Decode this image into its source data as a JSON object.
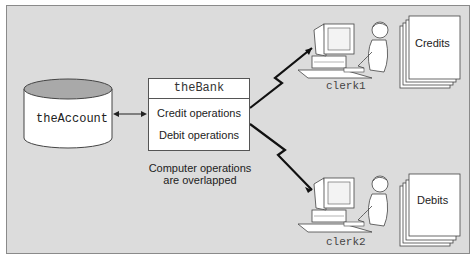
{
  "diagram": {
    "account": {
      "label": "theAccount",
      "shape": "cylinder-database"
    },
    "bank": {
      "title": "theBank",
      "operations": [
        "Credit operations",
        "Debit operations"
      ]
    },
    "caption": {
      "line1": "Computer operations",
      "line2": "are overlapped"
    },
    "clerks": [
      {
        "name": "clerk1",
        "document": "Credits",
        "icon": "clerk-at-computer-icon"
      },
      {
        "name": "clerk2",
        "document": "Debits",
        "icon": "clerk-at-computer-icon"
      }
    ],
    "connections": [
      {
        "from": "theAccount",
        "to": "theBank",
        "type": "bidirectional-arrow"
      },
      {
        "from": "theBank",
        "to": "clerk1",
        "type": "lightning-link"
      },
      {
        "from": "theBank",
        "to": "clerk2",
        "type": "lightning-link"
      }
    ],
    "colors": {
      "background": "#dcdcdc",
      "box_fill": "#ffffff",
      "cylinder_top": "#a9a9a9",
      "stroke": "#333333"
    }
  }
}
